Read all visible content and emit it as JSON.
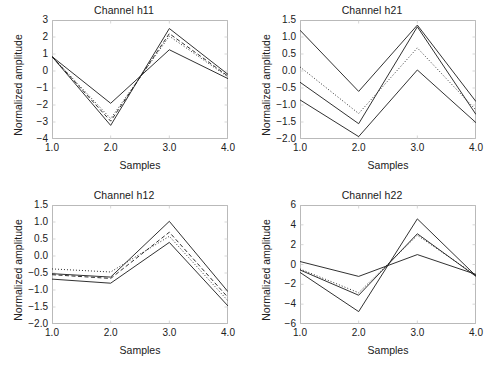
{
  "figure": {
    "width": 496,
    "height": 370,
    "background": "#ffffff",
    "layout": "2x2 subplot grid",
    "line_color": "#1a1a1a",
    "frame_color": "#b9b9b9"
  },
  "common": {
    "xlabel": "Samples",
    "ylabel": "Normalized amplitude",
    "xticks": [
      "1.0",
      "2.0",
      "3.0",
      "4.0"
    ],
    "xvalues": [
      1.0,
      2.0,
      3.0,
      4.0
    ]
  },
  "chart_data": [
    {
      "type": "line",
      "title": "Channel h11",
      "xlabel": "Samples",
      "ylabel": "Normalized amplitude",
      "x": [
        1.0,
        2.0,
        3.0,
        4.0
      ],
      "xlim": [
        1.0,
        4.0
      ],
      "ylim": [
        -4,
        3
      ],
      "yticks": [
        -4,
        -3,
        -2,
        -1,
        0,
        1,
        2,
        3
      ],
      "ytick_labels": [
        "-4",
        "-3",
        "-2",
        "-1",
        "0",
        "1",
        "2",
        "3"
      ],
      "grid": false,
      "legend": "none",
      "series": [
        {
          "name": "upper-solid",
          "style": "solid",
          "values": [
            0.85,
            -3.2,
            2.5,
            -0.2
          ]
        },
        {
          "name": "mid-dashed",
          "style": "dashed",
          "values": [
            0.85,
            -2.95,
            2.2,
            -0.3
          ]
        },
        {
          "name": "mid-dotted",
          "style": "dotted",
          "values": [
            0.85,
            -2.8,
            2.05,
            -0.35
          ]
        },
        {
          "name": "lower-solid",
          "style": "solid",
          "values": [
            0.85,
            -1.9,
            1.25,
            -0.45
          ]
        }
      ]
    },
    {
      "type": "line",
      "title": "Channel h21",
      "xlabel": "Samples",
      "ylabel": "Normalized amplitude",
      "x": [
        1.0,
        2.0,
        3.0,
        4.0
      ],
      "xlim": [
        1.0,
        4.0
      ],
      "ylim": [
        -2.0,
        1.5
      ],
      "yticks": [
        -2.0,
        -1.5,
        -1.0,
        -0.5,
        0.0,
        0.5,
        1.0,
        1.5
      ],
      "ytick_labels": [
        "-2.0",
        "-1.5",
        "-1.0",
        "-0.5",
        "0.0",
        "0.5",
        "1.0",
        "1.5"
      ],
      "grid": false,
      "legend": "none",
      "series": [
        {
          "name": "upper-solid",
          "style": "solid",
          "values": [
            1.2,
            -0.6,
            1.35,
            -0.9
          ]
        },
        {
          "name": "mid-dotted",
          "style": "dotted",
          "values": [
            0.12,
            -1.25,
            0.68,
            -1.15
          ]
        },
        {
          "name": "mid-solid",
          "style": "solid",
          "values": [
            -0.33,
            -1.55,
            1.3,
            -1.28
          ]
        },
        {
          "name": "lower-solid",
          "style": "solid",
          "values": [
            -0.85,
            -1.93,
            0.03,
            -1.52
          ]
        }
      ]
    },
    {
      "type": "line",
      "title": "Channel h12",
      "xlabel": "Samples",
      "ylabel": "Normalized amplitude",
      "x": [
        1.0,
        2.0,
        3.0,
        4.0
      ],
      "xlim": [
        1.0,
        4.0
      ],
      "ylim": [
        -2.0,
        1.5
      ],
      "yticks": [
        -2.0,
        -1.5,
        -1.0,
        -0.5,
        0.0,
        0.5,
        1.0,
        1.5
      ],
      "ytick_labels": [
        "-2.0",
        "-1.5",
        "-1.0",
        "-0.5",
        "0.0",
        "0.5",
        "1.0",
        "1.5"
      ],
      "grid": false,
      "legend": "none",
      "series": [
        {
          "name": "upper-solid",
          "style": "solid",
          "values": [
            -0.52,
            -0.62,
            1.02,
            -1.05
          ]
        },
        {
          "name": "mid-dashed",
          "style": "dashed",
          "values": [
            -0.55,
            -0.66,
            0.7,
            -1.22
          ]
        },
        {
          "name": "mid-dotted",
          "style": "dotted",
          "values": [
            -0.38,
            -0.47,
            0.58,
            -1.32
          ]
        },
        {
          "name": "lower-solid",
          "style": "solid",
          "values": [
            -0.68,
            -0.8,
            0.4,
            -1.47
          ]
        }
      ]
    },
    {
      "type": "line",
      "title": "Channel h22",
      "xlabel": "Samples",
      "ylabel": "Normalized amplitude",
      "x": [
        1.0,
        2.0,
        3.0,
        4.0
      ],
      "xlim": [
        -6,
        6
      ],
      "ylim": [
        -6,
        6
      ],
      "yticks": [
        -6,
        -4,
        -2,
        0,
        2,
        4,
        6
      ],
      "ytick_labels": [
        "-6",
        "-4",
        "-2",
        "0",
        "2",
        "4",
        "6"
      ],
      "grid": false,
      "legend": "none",
      "series": [
        {
          "name": "upper-solid",
          "style": "solid",
          "values": [
            -0.8,
            -4.75,
            4.6,
            -1.15
          ]
        },
        {
          "name": "mid-solid",
          "style": "solid",
          "values": [
            -0.55,
            -3.1,
            3.1,
            -1.2
          ]
        },
        {
          "name": "mid-dotted",
          "style": "dotted",
          "values": [
            -0.45,
            -2.85,
            2.95,
            -1.1
          ]
        },
        {
          "name": "lower-solid",
          "style": "solid",
          "values": [
            0.3,
            -1.2,
            1.0,
            -1.0
          ]
        }
      ]
    }
  ]
}
